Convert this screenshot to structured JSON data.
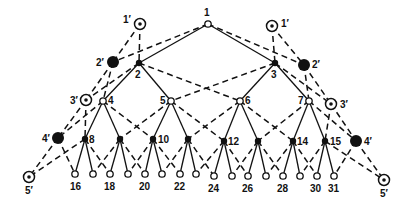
{
  "diagram": {
    "type": "binary-tree-with-auxiliary-chain",
    "colors": {
      "ink": "#111111",
      "background": "#ffffff"
    },
    "nodes": [
      {
        "id": "1",
        "label": "1",
        "x": 208,
        "y": 24,
        "style": "open",
        "lx": 204,
        "ly": 16
      },
      {
        "id": "2",
        "label": "2",
        "x": 139,
        "y": 63,
        "style": "filled-small",
        "lx": 135,
        "ly": 78
      },
      {
        "id": "3",
        "label": "3",
        "x": 275,
        "y": 63,
        "style": "filled-small",
        "lx": 271,
        "ly": 78
      },
      {
        "id": "4",
        "label": "4",
        "x": 103,
        "y": 101,
        "style": "open",
        "lx": 108,
        "ly": 104
      },
      {
        "id": "5",
        "label": "5",
        "x": 171,
        "y": 101,
        "style": "open",
        "lx": 160,
        "ly": 104
      },
      {
        "id": "6",
        "label": "6",
        "x": 240,
        "y": 101,
        "style": "open",
        "lx": 245,
        "ly": 104
      },
      {
        "id": "7",
        "label": "7",
        "x": 309,
        "y": 101,
        "style": "open",
        "lx": 298,
        "ly": 104
      },
      {
        "id": "8",
        "label": "8",
        "x": 85,
        "y": 139,
        "style": "filled-small",
        "lx": 89,
        "ly": 143
      },
      {
        "id": "9",
        "label": "",
        "x": 120,
        "y": 139,
        "style": "filled-small"
      },
      {
        "id": "10",
        "label": "10",
        "x": 153,
        "y": 139,
        "style": "filled-small",
        "lx": 158,
        "ly": 143
      },
      {
        "id": "11",
        "label": "",
        "x": 188,
        "y": 139,
        "style": "filled-small"
      },
      {
        "id": "12",
        "label": "12",
        "x": 224,
        "y": 141,
        "style": "filled-small",
        "lx": 228,
        "ly": 145
      },
      {
        "id": "13",
        "label": "",
        "x": 258,
        "y": 141,
        "style": "filled-small"
      },
      {
        "id": "14",
        "label": "14",
        "x": 293,
        "y": 141,
        "style": "filled-small",
        "lx": 297,
        "ly": 145
      },
      {
        "id": "15",
        "label": "15",
        "x": 325,
        "y": 141,
        "style": "filled-small",
        "lx": 330,
        "ly": 145
      },
      {
        "id": "16",
        "label": "16",
        "x": 75,
        "y": 174,
        "style": "open",
        "lx": 70,
        "ly": 190
      },
      {
        "id": "17",
        "label": "",
        "x": 93,
        "y": 174,
        "style": "open"
      },
      {
        "id": "18",
        "label": "18",
        "x": 110,
        "y": 174,
        "style": "open",
        "lx": 104,
        "ly": 190
      },
      {
        "id": "19",
        "label": "",
        "x": 128,
        "y": 174,
        "style": "open"
      },
      {
        "id": "20",
        "label": "20",
        "x": 145,
        "y": 174,
        "style": "open",
        "lx": 139,
        "ly": 190
      },
      {
        "id": "21",
        "label": "",
        "x": 162,
        "y": 174,
        "style": "open"
      },
      {
        "id": "22",
        "label": "22",
        "x": 180,
        "y": 174,
        "style": "open",
        "lx": 174,
        "ly": 190
      },
      {
        "id": "23",
        "label": "",
        "x": 196,
        "y": 174,
        "style": "open"
      },
      {
        "id": "24",
        "label": "24",
        "x": 214,
        "y": 176,
        "style": "open",
        "lx": 208,
        "ly": 192
      },
      {
        "id": "25",
        "label": "",
        "x": 232,
        "y": 176,
        "style": "open"
      },
      {
        "id": "26",
        "label": "26",
        "x": 248,
        "y": 176,
        "style": "open",
        "lx": 242,
        "ly": 192
      },
      {
        "id": "27",
        "label": "",
        "x": 266,
        "y": 176,
        "style": "open"
      },
      {
        "id": "28",
        "label": "28",
        "x": 283,
        "y": 176,
        "style": "open",
        "lx": 277,
        "ly": 192
      },
      {
        "id": "29",
        "label": "",
        "x": 300,
        "y": 176,
        "style": "open"
      },
      {
        "id": "30",
        "label": "30",
        "x": 317,
        "y": 176,
        "style": "open",
        "lx": 310,
        "ly": 192
      },
      {
        "id": "31",
        "label": "31",
        "x": 334,
        "y": 176,
        "style": "open",
        "lx": 328,
        "ly": 192
      },
      {
        "id": "1pL",
        "label": "1′",
        "x": 140,
        "y": 24,
        "style": "target",
        "lx": 123,
        "ly": 23
      },
      {
        "id": "1pR",
        "label": "1′",
        "x": 272,
        "y": 26,
        "style": "target",
        "lx": 281,
        "ly": 27
      },
      {
        "id": "2pL",
        "label": "2′",
        "x": 113,
        "y": 62,
        "style": "filled-large",
        "lx": 96,
        "ly": 66
      },
      {
        "id": "2pR",
        "label": "2′",
        "x": 304,
        "y": 65,
        "style": "filled-large",
        "lx": 312,
        "ly": 68
      },
      {
        "id": "3pL",
        "label": "3′",
        "x": 86,
        "y": 100,
        "style": "target",
        "lx": 70,
        "ly": 104
      },
      {
        "id": "3pR",
        "label": "3′",
        "x": 331,
        "y": 104,
        "style": "target",
        "lx": 340,
        "ly": 108
      },
      {
        "id": "4pL",
        "label": "4′",
        "x": 58,
        "y": 138,
        "style": "filled-large",
        "lx": 42,
        "ly": 142
      },
      {
        "id": "4pR",
        "label": "4′",
        "x": 356,
        "y": 141,
        "style": "filled-large",
        "lx": 364,
        "ly": 145
      },
      {
        "id": "5pL",
        "label": "5′",
        "x": 29,
        "y": 177,
        "style": "target",
        "lx": 25,
        "ly": 194
      },
      {
        "id": "5pR",
        "label": "5′",
        "x": 384,
        "y": 180,
        "style": "target",
        "lx": 380,
        "ly": 197
      }
    ],
    "solid_edges": [
      [
        "1",
        "2"
      ],
      [
        "1",
        "3"
      ],
      [
        "2",
        "4"
      ],
      [
        "2",
        "5"
      ],
      [
        "3",
        "6"
      ],
      [
        "3",
        "7"
      ],
      [
        "4",
        "8"
      ],
      [
        "4",
        "9"
      ],
      [
        "5",
        "10"
      ],
      [
        "5",
        "11"
      ],
      [
        "6",
        "12"
      ],
      [
        "6",
        "13"
      ],
      [
        "7",
        "14"
      ],
      [
        "7",
        "15"
      ],
      [
        "8",
        "16"
      ],
      [
        "8",
        "17"
      ],
      [
        "9",
        "18"
      ],
      [
        "9",
        "19"
      ],
      [
        "10",
        "20"
      ],
      [
        "10",
        "21"
      ],
      [
        "11",
        "22"
      ],
      [
        "11",
        "23"
      ],
      [
        "12",
        "24"
      ],
      [
        "12",
        "25"
      ],
      [
        "13",
        "26"
      ],
      [
        "13",
        "27"
      ],
      [
        "14",
        "28"
      ],
      [
        "14",
        "29"
      ],
      [
        "15",
        "30"
      ],
      [
        "15",
        "31"
      ]
    ],
    "dashed_edges": [
      [
        "1",
        "2pL"
      ],
      [
        "1",
        "2pR"
      ],
      [
        "1pL",
        "2pL"
      ],
      [
        "1pL",
        "2"
      ],
      [
        "1pR",
        "2pR"
      ],
      [
        "1pR",
        "3"
      ],
      [
        "2pL",
        "3pL"
      ],
      [
        "2pL",
        "4"
      ],
      [
        "2pR",
        "3pR"
      ],
      [
        "2pR",
        "7"
      ],
      [
        "2",
        "3pL"
      ],
      [
        "2",
        "6"
      ],
      [
        "3",
        "5"
      ],
      [
        "3",
        "3pR"
      ],
      [
        "3pL",
        "4pL"
      ],
      [
        "3pL",
        "8"
      ],
      [
        "3pR",
        "4pR"
      ],
      [
        "3pR",
        "15"
      ],
      [
        "4",
        "4pL"
      ],
      [
        "4",
        "10"
      ],
      [
        "5",
        "9"
      ],
      [
        "5",
        "12"
      ],
      [
        "6",
        "11"
      ],
      [
        "6",
        "14"
      ],
      [
        "7",
        "13"
      ],
      [
        "7",
        "4pR"
      ],
      [
        "4pL",
        "5pL"
      ],
      [
        "4pL",
        "16"
      ],
      [
        "4pR",
        "5pR"
      ],
      [
        "4pR",
        "31"
      ],
      [
        "8",
        "5pL"
      ],
      [
        "8",
        "18"
      ],
      [
        "9",
        "17"
      ],
      [
        "9",
        "20"
      ],
      [
        "10",
        "19"
      ],
      [
        "10",
        "22"
      ],
      [
        "11",
        "21"
      ],
      [
        "11",
        "24"
      ],
      [
        "12",
        "23"
      ],
      [
        "12",
        "26"
      ],
      [
        "13",
        "25"
      ],
      [
        "13",
        "28"
      ],
      [
        "14",
        "27"
      ],
      [
        "14",
        "30"
      ],
      [
        "15",
        "29"
      ],
      [
        "15",
        "5pR"
      ]
    ]
  }
}
